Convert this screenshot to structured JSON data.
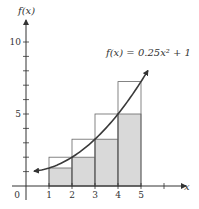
{
  "chart_data": {
    "type": "bar",
    "title": "",
    "function_label": "f(x) = 0.25x² + 1",
    "function": {
      "a": 0.25,
      "b": 0,
      "c": 1
    },
    "xlabel": "x",
    "ylabel": "f(x)",
    "xlim": [
      0,
      6.5
    ],
    "ylim": [
      0,
      11
    ],
    "x_ticks": [
      1,
      2,
      3,
      4,
      5,
      6
    ],
    "x_tick_labels": [
      "1",
      "2",
      "3",
      "4",
      "5"
    ],
    "y_ticks": [
      1,
      2,
      3,
      4,
      5,
      6,
      7,
      8,
      9,
      10
    ],
    "y_tick_labels": [
      "5",
      "10"
    ],
    "origin_label": "0",
    "grid": false,
    "categories": [
      "[1,2]",
      "[2,3]",
      "[3,4]",
      "[4,5]"
    ],
    "series": [
      {
        "name": "lower rectangles (shaded)",
        "x_left": [
          1,
          2,
          3,
          4
        ],
        "width": 1,
        "values": [
          1.25,
          2,
          3.25,
          5
        ]
      },
      {
        "name": "upper rectangles (outlined)",
        "x_left": [
          1,
          2,
          3,
          4
        ],
        "width": 1,
        "values": [
          2,
          3.25,
          5,
          7.25
        ]
      }
    ],
    "curve": {
      "x_start": 0.35,
      "x_end": 5.3,
      "arrows": "both"
    }
  },
  "colors": {
    "axis": "#333333",
    "shade": "#d9d9d9",
    "rect_stroke": "#666666",
    "curve": "#3a3a3a"
  }
}
